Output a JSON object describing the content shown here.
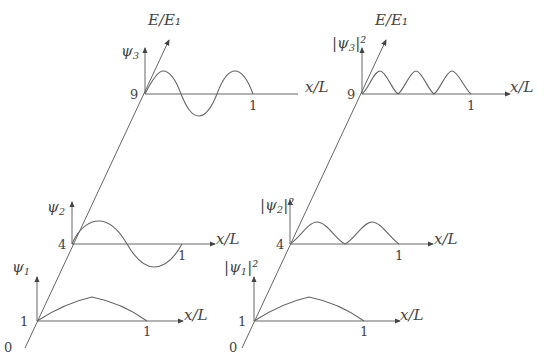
{
  "diagram": {
    "energy_axis_label": "E/E₁",
    "x_axis_label": "x/L",
    "x_tick": "1",
    "origin_label": "0",
    "panels": [
      {
        "name": "wavefunctions",
        "levels": [
          {
            "n": 1,
            "energy": "1",
            "ylabel_sym": "ψ",
            "ylabel_sub": "1",
            "ylabel_sup": ""
          },
          {
            "n": 2,
            "energy": "4",
            "ylabel_sym": "ψ",
            "ylabel_sub": "2",
            "ylabel_sup": ""
          },
          {
            "n": 3,
            "energy": "9",
            "ylabel_sym": "ψ",
            "ylabel_sub": "3",
            "ylabel_sup": ""
          }
        ]
      },
      {
        "name": "probability-densities",
        "levels": [
          {
            "n": 1,
            "energy": "1",
            "ylabel_sym": "|ψ",
            "ylabel_sub": "1",
            "ylabel_sup": "|²"
          },
          {
            "n": 2,
            "energy": "4",
            "ylabel_sym": "|ψ",
            "ylabel_sub": "2",
            "ylabel_sup": "|²"
          },
          {
            "n": 3,
            "energy": "9",
            "ylabel_sym": "|ψ",
            "ylabel_sub": "3",
            "ylabel_sup": "|²"
          }
        ]
      }
    ]
  }
}
